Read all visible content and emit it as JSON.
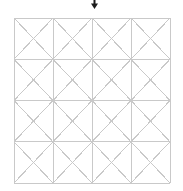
{
  "canvas": {
    "width": 183,
    "height": 191,
    "background_color": "#ffffff"
  },
  "figure": {
    "name": "grid-with-diagonals",
    "rows": 4,
    "columns": 4,
    "cell_count": 16,
    "bounds": {
      "left": 14,
      "top": 18,
      "right": 170,
      "bottom": 183,
      "width": 156,
      "height": 165
    },
    "cell_width": 39,
    "cell_height": 41.25,
    "vertical_line_x": [
      14,
      53,
      92,
      131,
      170
    ],
    "horizontal_line_y": [
      18,
      59.25,
      100.5,
      141.75,
      183
    ],
    "line_color": "#c9c9c9",
    "diagonal_color": "#c9c9c9",
    "border_color": "#c9c9c9",
    "line_width": 1,
    "diagonals_per_cell": 2
  },
  "cursor": {
    "name": "pointer-arrow",
    "glyph": "down-arrow",
    "color": "#1c1c1c",
    "x": 91,
    "y": 0,
    "width": 7,
    "height": 9,
    "direction": "down"
  }
}
